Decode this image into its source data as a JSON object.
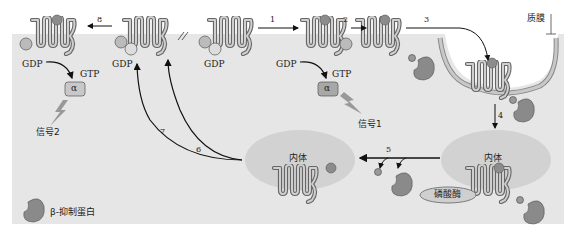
{
  "diagram": {
    "labels": {
      "membrane": "质膜",
      "endosome_left": "内体",
      "endosome_right": "内体",
      "phosphatase": "磷酸酶",
      "signal1": "信号1",
      "signal2": "信号2",
      "legend_arr_text": "β-抑制蛋白",
      "legend_arr_symbol": "Arr",
      "gdp_1": "GDP",
      "gdp_2": "GDP",
      "gdp_3": "GDP",
      "gdp_4": "GDP",
      "gtp_1": "GTP",
      "gtp_2": "GTP",
      "alpha": "α",
      "beta_gamma": "βγ",
      "phospho": "P",
      "arr": "Arr"
    },
    "steps": [
      "1",
      "2",
      "3",
      "4",
      "5",
      "6",
      "7",
      "8"
    ],
    "colors": {
      "cytoplasm": "#e6e6e6",
      "endosome": "#d2d2d2",
      "receptor": "#9a9a9a",
      "ligand": "#8c8c8c",
      "arrow": "#111111"
    }
  }
}
